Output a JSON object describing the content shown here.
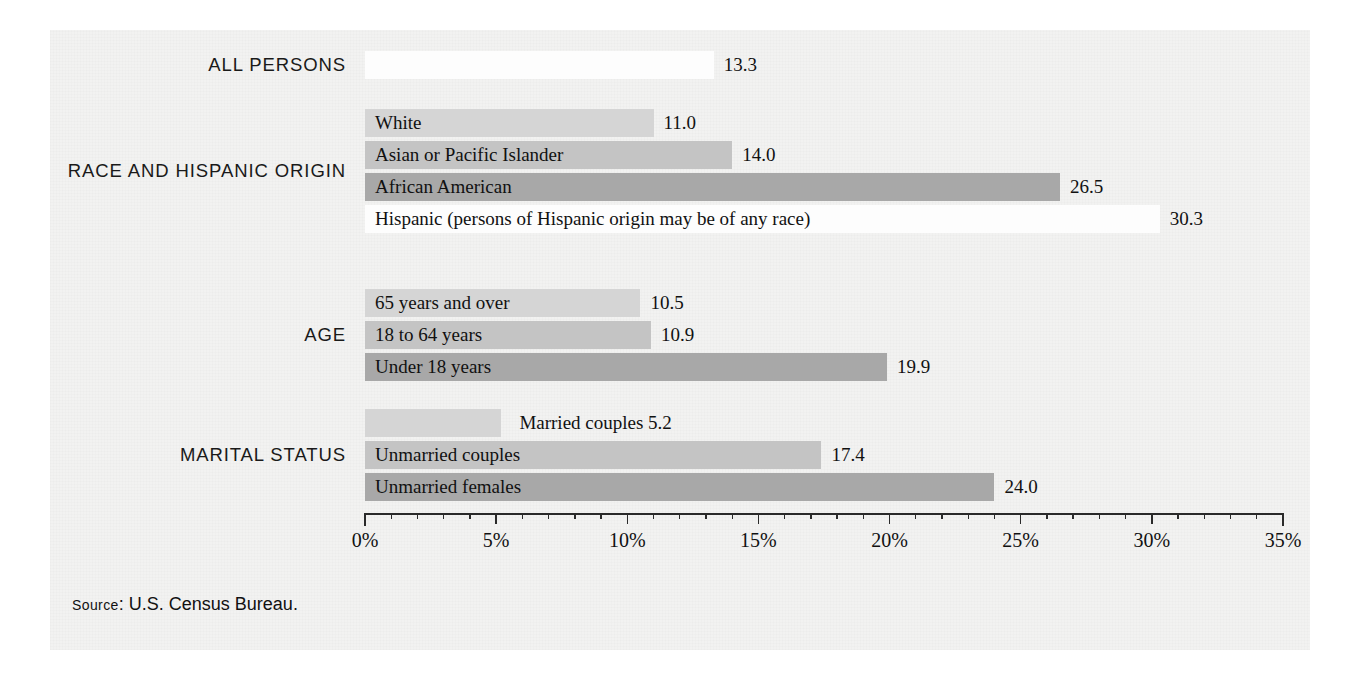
{
  "source_note": {
    "prefix": "Source",
    "separator": ":",
    "text": "U.S. Census Bureau."
  },
  "colors": {
    "panel_background": "#f2f2f1",
    "shade_lightest": "#fdfdfd",
    "shade_light": "#d5d5d5",
    "shade_medium": "#c4c4c4",
    "shade_dark": "#a8a8a8",
    "axis": "#2a2a2a",
    "text": "#111111"
  },
  "chart_data": {
    "type": "bar",
    "orientation": "horizontal",
    "title": "",
    "xlabel": "",
    "ylabel": "",
    "xlim": [
      0,
      35
    ],
    "xtick_labels": [
      "0%",
      "5%",
      "10%",
      "15%",
      "20%",
      "25%",
      "30%",
      "35%"
    ],
    "xtick_values": [
      0,
      5,
      10,
      15,
      20,
      25,
      30,
      35
    ],
    "minor_tick_step": 1,
    "grid": false,
    "legend": "none",
    "value_unit": "percent",
    "groups": [
      {
        "label": "ALL PERSONS",
        "bars": [
          {
            "name": "",
            "value": 13.3,
            "value_text": "13.3",
            "shade": "shade_lightest",
            "label_inside": false
          }
        ]
      },
      {
        "label": "RACE AND HISPANIC ORIGIN",
        "bars": [
          {
            "name": "White",
            "value": 11.0,
            "value_text": "11.0",
            "shade": "shade_light",
            "label_inside": true
          },
          {
            "name": "Asian or Pacific Islander",
            "value": 14.0,
            "value_text": "14.0",
            "shade": "shade_medium",
            "label_inside": true
          },
          {
            "name": "African American",
            "value": 26.5,
            "value_text": "26.5",
            "shade": "shade_dark",
            "label_inside": true
          },
          {
            "name": "Hispanic (persons of Hispanic origin may be of any race)",
            "value": 30.3,
            "value_text": "30.3",
            "shade": "shade_lightest",
            "label_inside": true
          }
        ]
      },
      {
        "label": "AGE",
        "bars": [
          {
            "name": "65 years and over",
            "value": 10.5,
            "value_text": "10.5",
            "shade": "shade_light",
            "label_inside": true
          },
          {
            "name": "18 to 64 years",
            "value": 10.9,
            "value_text": "10.9",
            "shade": "shade_medium",
            "label_inside": true
          },
          {
            "name": "Under 18 years",
            "value": 19.9,
            "value_text": "19.9",
            "shade": "shade_dark",
            "label_inside": true
          }
        ]
      },
      {
        "label": "MARITAL STATUS",
        "bars": [
          {
            "name": "Married couples",
            "value": 5.2,
            "value_text": "5.2",
            "shade": "shade_light",
            "label_inside": false
          },
          {
            "name": "Unmarried couples",
            "value": 17.4,
            "value_text": "17.4",
            "shade": "shade_medium",
            "label_inside": true
          },
          {
            "name": "Unmarried females",
            "value": 24.0,
            "value_text": "24.0",
            "shade": "shade_dark",
            "label_inside": true
          }
        ]
      }
    ]
  }
}
